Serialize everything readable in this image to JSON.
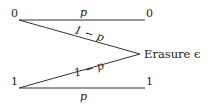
{
  "diagram": {
    "type": "binary-erasure-channel",
    "inputs": [
      {
        "label": "0"
      },
      {
        "label": "1"
      }
    ],
    "outputs": [
      {
        "label": "0"
      },
      {
        "label": "1"
      },
      {
        "label": "Erasure ϵ"
      }
    ],
    "edges": [
      {
        "from": "0",
        "to": "0",
        "label": "p"
      },
      {
        "from": "0",
        "to": "Erasure",
        "label": "1 − p"
      },
      {
        "from": "1",
        "to": "Erasure",
        "label": "1 − p"
      },
      {
        "from": "1",
        "to": "1",
        "label": "p"
      }
    ],
    "line_color": "#333333",
    "text_color": "#222222"
  }
}
